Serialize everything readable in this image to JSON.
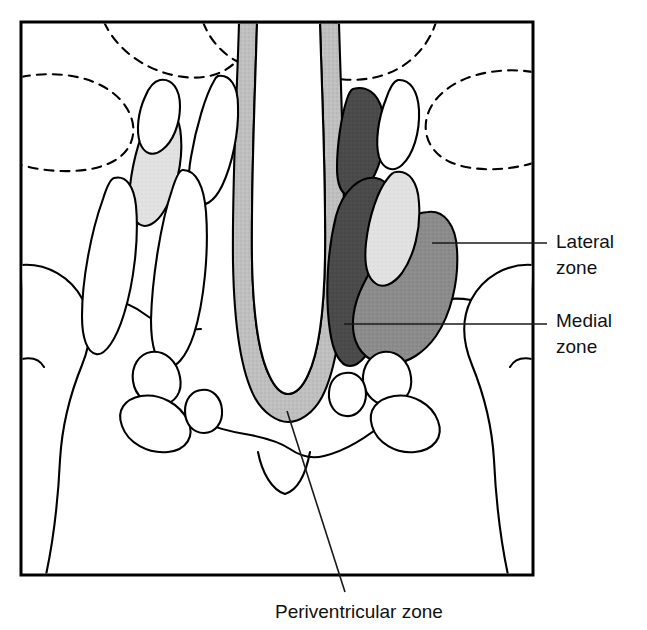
{
  "figure": {
    "frame": {
      "x": 21,
      "y": 22,
      "width": 512,
      "height": 553,
      "stroke": "#000000",
      "stroke_width": 3
    },
    "colors": {
      "outline": "#000000",
      "background": "#ffffff",
      "medial_zone_fill": "#4a4a4a",
      "lateral_zone_fill": "#8c8c8c",
      "periventricular_zone_fill": "#bfbfbf",
      "pale_nucleus_fill": "#e2e2e2",
      "unshaded_fill": "#ffffff",
      "leader_line": "#1a1a1a"
    }
  },
  "labels": [
    {
      "id": "lateral-zone",
      "line1": "Lateral",
      "line2": "zone",
      "text_x": 556,
      "text_y": 248,
      "leader": {
        "x1": 432,
        "y1": 243,
        "x2": 547,
        "y2": 243
      }
    },
    {
      "id": "medial-zone",
      "line1": "Medial",
      "line2": "zone",
      "text_x": 556,
      "text_y": 327,
      "leader": {
        "x1": 344,
        "y1": 324,
        "x2": 547,
        "y2": 324
      }
    },
    {
      "id": "periventricular-zone",
      "line1": "Periventricular zone",
      "line2": "",
      "text_x": 275,
      "text_y": 618,
      "leader": {
        "x1": 287,
        "y1": 411,
        "x2": 345,
        "y2": 592
      }
    }
  ],
  "legend_semantics": {
    "medial_zone": "Medial zone",
    "lateral_zone": "Lateral zone",
    "periventricular_zone": "Periventricular zone"
  }
}
